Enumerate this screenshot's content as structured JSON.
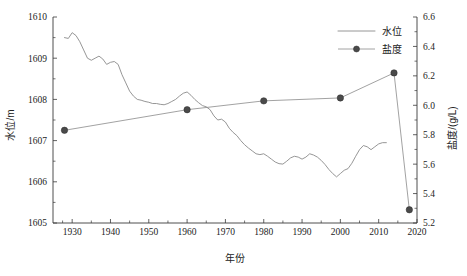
{
  "chart_data": {
    "type": "line",
    "title": "",
    "subtitle": "",
    "xlabel": "年份",
    "ylabel": "水位/m",
    "y2label": "盐度/(g/L)",
    "xlim": [
      1925,
      2020
    ],
    "ylim": [
      1605,
      1610
    ],
    "y2lim": [
      5.2,
      6.6
    ],
    "grid": false,
    "legend_position": "top-right",
    "xticks": [
      1930,
      1940,
      1950,
      1960,
      1970,
      1980,
      1990,
      2000,
      2010,
      2020
    ],
    "xtick_labels": [
      "1930",
      "1940",
      "1950",
      "1960",
      "1970",
      "1980",
      "1990",
      "2000",
      "2010",
      "2020"
    ],
    "yticks": [
      1605,
      1606,
      1607,
      1608,
      1609,
      1610
    ],
    "ytick_labels": [
      "1605",
      "1606",
      "1607",
      "1608",
      "1609",
      "1610"
    ],
    "y2ticks": [
      5.2,
      5.4,
      5.6,
      5.8,
      6.0,
      6.2,
      6.4,
      6.6
    ],
    "y2tick_labels": [
      "5.2",
      "5.4",
      "5.6",
      "5.8",
      "6.0",
      "6.2",
      "6.4",
      "6.6"
    ],
    "series": [
      {
        "name": "水位",
        "axis": "left",
        "marker": "none",
        "color": "#8a8a8a",
        "x": [
          1928,
          1929,
          1930,
          1931,
          1932,
          1933,
          1934,
          1935,
          1936,
          1937,
          1938,
          1939,
          1940,
          1941,
          1942,
          1943,
          1944,
          1945,
          1946,
          1947,
          1948,
          1949,
          1950,
          1951,
          1952,
          1953,
          1954,
          1955,
          1956,
          1957,
          1958,
          1959,
          1960,
          1961,
          1962,
          1963,
          1964,
          1965,
          1966,
          1967,
          1968,
          1969,
          1970,
          1971,
          1972,
          1973,
          1974,
          1975,
          1976,
          1977,
          1978,
          1979,
          1980,
          1981,
          1982,
          1983,
          1984,
          1985,
          1986,
          1987,
          1988,
          1989,
          1990,
          1991,
          1992,
          1993,
          1994,
          1995,
          1996,
          1997,
          1998,
          1999,
          2000,
          2001,
          2002,
          2003,
          2004,
          2005,
          2006,
          2007,
          2008,
          2009,
          2010,
          2011,
          2012
        ],
        "y": [
          1609.5,
          1609.48,
          1609.62,
          1609.55,
          1609.4,
          1609.2,
          1609.0,
          1608.95,
          1609.0,
          1609.05,
          1608.98,
          1608.85,
          1608.9,
          1608.92,
          1608.85,
          1608.6,
          1608.4,
          1608.2,
          1608.08,
          1608.0,
          1607.98,
          1607.95,
          1607.93,
          1607.9,
          1607.9,
          1607.88,
          1607.87,
          1607.9,
          1607.95,
          1608.0,
          1608.08,
          1608.15,
          1608.18,
          1608.1,
          1608.0,
          1607.92,
          1607.85,
          1607.82,
          1607.75,
          1607.6,
          1607.5,
          1607.52,
          1607.45,
          1607.3,
          1607.2,
          1607.12,
          1607.0,
          1606.9,
          1606.82,
          1606.75,
          1606.68,
          1606.66,
          1606.68,
          1606.62,
          1606.55,
          1606.48,
          1606.44,
          1606.43,
          1606.5,
          1606.58,
          1606.62,
          1606.6,
          1606.55,
          1606.6,
          1606.68,
          1606.65,
          1606.6,
          1606.52,
          1606.42,
          1606.3,
          1606.2,
          1606.12,
          1606.2,
          1606.28,
          1606.32,
          1606.45,
          1606.62,
          1606.78,
          1606.88,
          1606.85,
          1606.78,
          1606.85,
          1606.92,
          1606.95,
          1606.95
        ]
      },
      {
        "name": "盐度",
        "axis": "right",
        "marker": "circle",
        "color": "#8a8a8a",
        "x": [
          1928,
          1960,
          1980,
          2000,
          2014,
          2018
        ],
        "y": [
          5.83,
          5.97,
          6.03,
          6.05,
          6.22,
          5.29
        ]
      }
    ],
    "legend": [
      {
        "label": "水位",
        "marker": "none",
        "line": true
      },
      {
        "label": "盐度",
        "marker": "circle",
        "line": true
      }
    ]
  }
}
